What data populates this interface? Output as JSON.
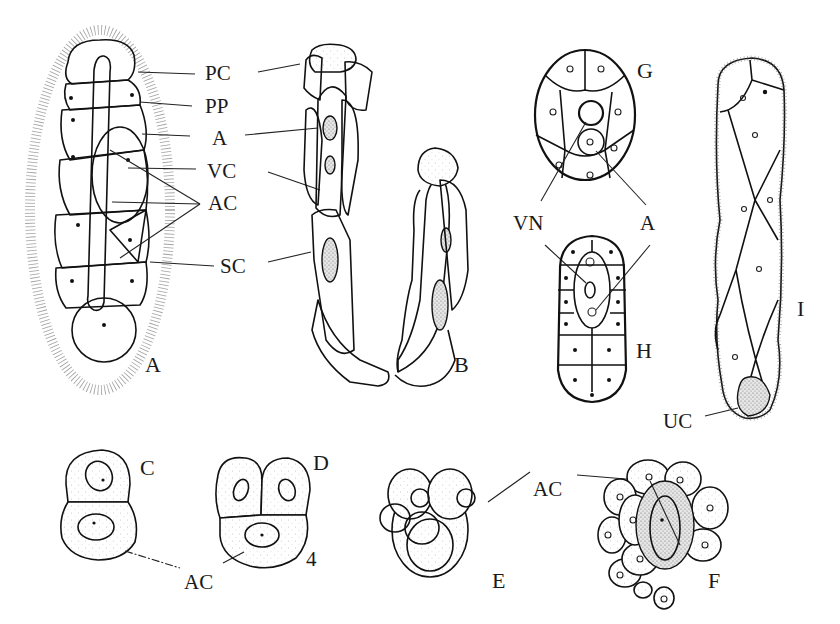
{
  "figure": {
    "panels": [
      {
        "id": "A",
        "label": "A"
      },
      {
        "id": "B",
        "label": "B"
      },
      {
        "id": "C",
        "label": "C"
      },
      {
        "id": "D",
        "label": "D"
      },
      {
        "id": "E",
        "label": "E"
      },
      {
        "id": "F",
        "label": "F"
      },
      {
        "id": "G",
        "label": "G"
      },
      {
        "id": "H",
        "label": "H"
      },
      {
        "id": "I",
        "label": "I"
      }
    ],
    "annotations": {
      "pc": "PC",
      "pp": "PP",
      "a_center": "A",
      "vc": "VC",
      "ac_center": "AC",
      "sc": "SC",
      "vn": "VN",
      "a_gh": "A",
      "uc": "UC",
      "ac_cd": "AC",
      "cell_count_d": "4",
      "ac_ef": "AC"
    }
  }
}
